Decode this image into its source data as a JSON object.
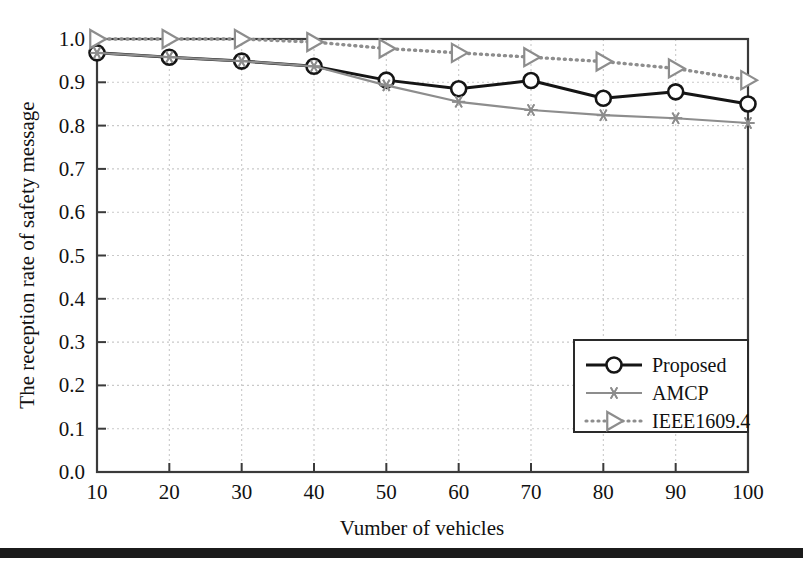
{
  "chart_data": {
    "type": "line",
    "title": "",
    "xlabel": "Vumber of vehicles",
    "ylabel": "The reception rate of safety message",
    "x": [
      10,
      20,
      30,
      40,
      50,
      60,
      70,
      80,
      90,
      100
    ],
    "xlim": [
      10,
      100
    ],
    "ylim": [
      0.0,
      1.0
    ],
    "xticks": [
      "10",
      "20",
      "30",
      "40",
      "50",
      "60",
      "70",
      "80",
      "90",
      "100"
    ],
    "yticks": [
      "0.0",
      "0.1",
      "0.2",
      "0.3",
      "0.4",
      "0.5",
      "0.6",
      "0.7",
      "0.8",
      "0.9",
      "1.0"
    ],
    "grid": true,
    "legend_position": "lower right",
    "series": [
      {
        "name": "Proposed",
        "marker": "circle",
        "linestyle": "solid",
        "color": "#151515",
        "values": [
          0.968,
          0.958,
          0.949,
          0.937,
          0.905,
          0.885,
          0.904,
          0.863,
          0.878,
          0.85
        ]
      },
      {
        "name": "AMCP",
        "marker": "asterisk",
        "linestyle": "solid",
        "color": "#8d8d8d",
        "values": [
          0.968,
          0.958,
          0.949,
          0.937,
          0.893,
          0.855,
          0.836,
          0.824,
          0.817,
          0.806
        ]
      },
      {
        "name": "IEEE1609.4",
        "marker": "triangle-right",
        "linestyle": "dotted",
        "color": "#8d8d8d",
        "values": [
          1.0,
          1.0,
          1.0,
          0.993,
          0.978,
          0.968,
          0.958,
          0.948,
          0.932,
          0.905
        ]
      }
    ]
  },
  "axes": {
    "x_title": "Vumber of vehicles",
    "y_title": "The reception rate of safety message"
  },
  "legend": {
    "entries": [
      {
        "label": "Proposed"
      },
      {
        "label": "AMCP"
      },
      {
        "label": "IEEE1609.4"
      }
    ]
  },
  "colors": {
    "proposed": "#151515",
    "amcp": "#8d8d8d",
    "ieee": "#8d8d8d",
    "grid": "#c9c9c9",
    "frame": "#3a3a3a",
    "page_rule": "#1b1b1b"
  }
}
